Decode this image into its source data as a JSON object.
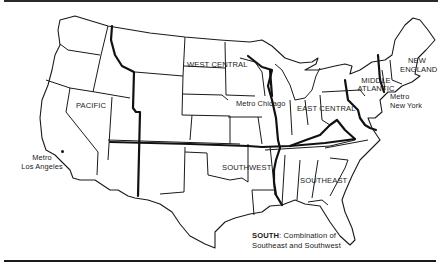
{
  "map": {
    "type": "US census-style regions map",
    "regions": [
      {
        "id": "pacific",
        "label": "PACIFIC"
      },
      {
        "id": "west-central",
        "label": "WEST CENTRAL"
      },
      {
        "id": "east-central",
        "label": "EAST CENTRAL"
      },
      {
        "id": "middle-atlantic",
        "label_line1": "MIDDLE",
        "label_line2": "ATLANTIC"
      },
      {
        "id": "new-england",
        "label_line1": "NEW",
        "label_line2": "ENGLAND"
      },
      {
        "id": "southwest",
        "label": "SOUTHWEST"
      },
      {
        "id": "southeast",
        "label": "SOUTHEAST"
      }
    ],
    "metros": [
      {
        "id": "los-angeles",
        "line1": "Metro",
        "line2": "Los Angeles"
      },
      {
        "id": "chicago",
        "label": "Metro Chicago"
      },
      {
        "id": "new-york",
        "line1": "Metro",
        "line2": "New York"
      }
    ],
    "note": {
      "line1_bold": "SOUTH",
      "line1_rest": ": Combination of",
      "line2": "Southeast and Southwest"
    }
  }
}
